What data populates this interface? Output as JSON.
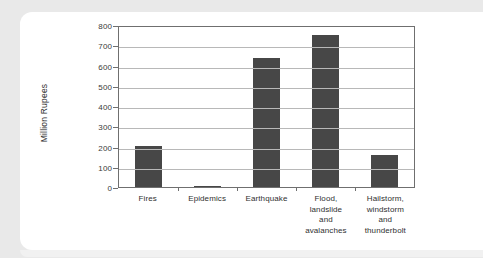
{
  "chart_data": {
    "type": "bar",
    "title": "",
    "xlabel": "",
    "ylabel": "Million Rupees",
    "ylim": [
      0,
      800
    ],
    "ytick_step": 100,
    "yticks": [
      "800",
      "700",
      "600",
      "500",
      "400",
      "300",
      "200",
      "100",
      "0"
    ],
    "grid": true,
    "legend": "none",
    "bar_color": "#474747",
    "categories": [
      "Fires",
      "Epidemics",
      "Earthquake",
      "Flood, landslide and avalanches",
      "Hailstorm, windstorm and thunderbolt"
    ],
    "category_lines": [
      [
        "Fires"
      ],
      [
        "Epidemics"
      ],
      [
        "Earthquake"
      ],
      [
        "Flood,",
        "landslide",
        "and",
        "avalanches"
      ],
      [
        "Hailstorm,",
        "windstorm",
        "and",
        "thunderbolt"
      ]
    ],
    "values": [
      205,
      3,
      635,
      750,
      160
    ]
  }
}
